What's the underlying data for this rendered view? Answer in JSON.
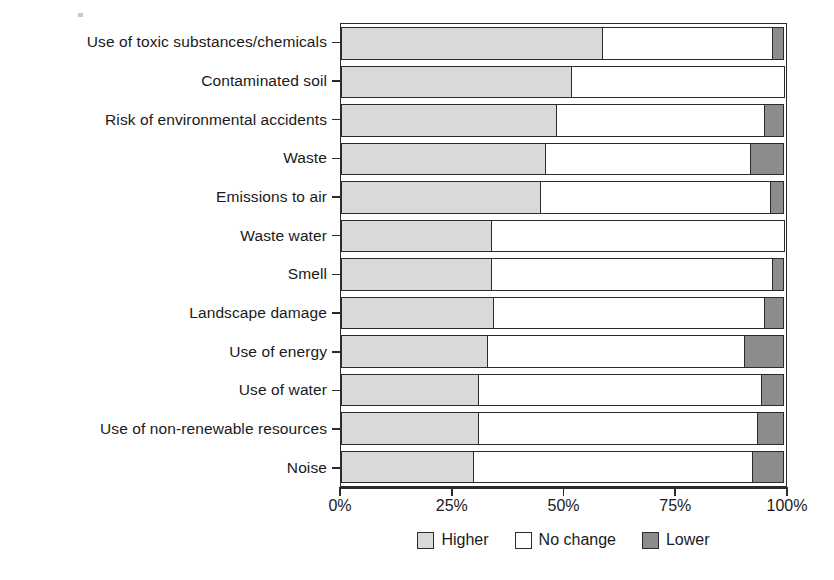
{
  "chart_data": {
    "type": "bar",
    "subtype": "stacked-horizontal-100percent",
    "title": "",
    "xlabel": "",
    "ylabel": "",
    "xlim": [
      0,
      100
    ],
    "xticks": [
      0,
      25,
      50,
      75,
      100
    ],
    "xticklabels": [
      "0%",
      "25%",
      "50%",
      "75%",
      "100%"
    ],
    "grid": false,
    "legend_position": "bottom",
    "legend": [
      "Higher",
      "No change",
      "Lower"
    ],
    "colors": {
      "higher": "#d9d9d9",
      "no_change": "#ffffff",
      "lower": "#8c8c8c",
      "outline": "#2b2b2b"
    },
    "categories": [
      "Use of toxic substances/chemicals",
      "Contaminated soil",
      "Risk of environmental accidents",
      "Waste",
      "Emissions to air",
      "Waste water",
      "Smell",
      "Landscape damage",
      "Use of energy",
      "Use of water",
      "Use of non-renewable resources",
      "Noise"
    ],
    "series": [
      {
        "name": "Higher",
        "values": [
          59,
          52,
          48.5,
          46,
          45,
          34,
          34,
          34.5,
          33,
          31,
          31,
          30
        ]
      },
      {
        "name": "No change",
        "values": [
          38.5,
          48,
          47.2,
          46.4,
          52,
          66,
          63.5,
          61,
          58,
          64,
          63,
          63
        ]
      },
      {
        "name": "Lower",
        "values": [
          2.5,
          0,
          4.3,
          7.6,
          3,
          0,
          2.5,
          4.5,
          9,
          5,
          6,
          7
        ]
      }
    ],
    "rows": [
      {
        "label": "Use of toxic substances/chemicals",
        "higher": 59,
        "no_change": 38.5,
        "lower": 2.5
      },
      {
        "label": "Contaminated soil",
        "higher": 52,
        "no_change": 48,
        "lower": 0
      },
      {
        "label": "Risk of environmental accidents",
        "higher": 48.5,
        "no_change": 47.2,
        "lower": 4.3
      },
      {
        "label": "Waste",
        "higher": 46,
        "no_change": 46.4,
        "lower": 7.6
      },
      {
        "label": "Emissions to air",
        "higher": 45,
        "no_change": 52,
        "lower": 3
      },
      {
        "label": "Waste water",
        "higher": 34,
        "no_change": 66,
        "lower": 0
      },
      {
        "label": "Smell",
        "higher": 34,
        "no_change": 63.5,
        "lower": 2.5
      },
      {
        "label": "Landscape damage",
        "higher": 34.5,
        "no_change": 61,
        "lower": 4.5
      },
      {
        "label": "Use of energy",
        "higher": 33,
        "no_change": 58,
        "lower": 9
      },
      {
        "label": "Use of water",
        "higher": 31,
        "no_change": 64,
        "lower": 5
      },
      {
        "label": "Use of non-renewable resources",
        "higher": 31,
        "no_change": 63,
        "lower": 6
      },
      {
        "label": "Noise",
        "higher": 30,
        "no_change": 63,
        "lower": 7
      }
    ]
  }
}
